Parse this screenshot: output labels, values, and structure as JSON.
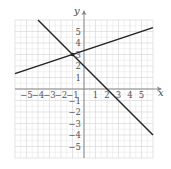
{
  "chart_data": {
    "type": "line",
    "title": "",
    "xlabel": "x",
    "ylabel": "y",
    "xlim": [
      -6,
      6
    ],
    "ylim": [
      -6,
      6
    ],
    "grid": true,
    "x_ticks": [
      "-5",
      "-4",
      "-3",
      "-2",
      "-1",
      "1",
      "2",
      "3",
      "4",
      "5"
    ],
    "y_ticks": [
      "5",
      "4",
      "3",
      "2",
      "1",
      "-1",
      "-2",
      "-3",
      "-4",
      "-5"
    ],
    "series": [
      {
        "name": "line 1",
        "equation": "y = x/3 + 10/3",
        "points": [
          [
            -6,
            1.33
          ],
          [
            6,
            5.33
          ]
        ]
      },
      {
        "name": "line 2",
        "equation": "y = -x + 2",
        "points": [
          [
            -4,
            6
          ],
          [
            6,
            -4
          ]
        ]
      }
    ],
    "annotations": [
      {
        "type": "point",
        "x": -1,
        "y": 3,
        "label": "intersection"
      }
    ]
  },
  "axes": {
    "x_label": "x",
    "y_label": "y"
  },
  "colors": {
    "grid": "#d8d8d8",
    "axis": "#888888",
    "line": "#222222"
  }
}
